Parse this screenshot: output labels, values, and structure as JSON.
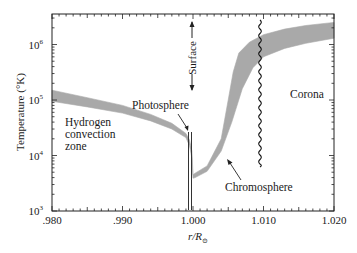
{
  "chart_data": {
    "type": "area",
    "title": "",
    "xlabel": "r/R⊙",
    "ylabel": "Temperature (°K)",
    "xlim": [
      0.98,
      1.02
    ],
    "ylim_log10": [
      3,
      6.55
    ],
    "yscale": "log",
    "grid": false,
    "legend": null,
    "x_ticks": [
      ".980",
      ".990",
      "1.000",
      "1.010",
      "1.020"
    ],
    "x_tick_values": [
      0.98,
      0.99,
      1.0,
      1.01,
      1.02
    ],
    "y_ticks": [
      "10^3",
      "10^4",
      "10^5",
      "10^6"
    ],
    "y_tick_values": [
      1000,
      10000,
      100000,
      1000000
    ],
    "series": [
      {
        "name": "Temperature band (upper bound)",
        "x": [
          0.98,
          0.985,
          0.99,
          0.994,
          0.997,
          0.999,
          0.9995,
          0.99985,
          1.0,
          1.0003,
          1.002,
          1.004,
          1.005,
          1.0057,
          1.0065,
          1.008,
          1.01,
          1.013,
          1.016,
          1.02
        ],
        "y": [
          150000,
          110000,
          80000,
          55000,
          38000,
          25000,
          19000,
          12000,
          4500,
          4800,
          6500,
          20000,
          100000,
          320000,
          700000,
          1100000,
          1500000,
          1900000,
          2200000,
          2500000
        ]
      },
      {
        "name": "Temperature band (lower bound)",
        "x": [
          0.98,
          0.985,
          0.99,
          0.994,
          0.997,
          0.999,
          0.9995,
          0.99985,
          1.0,
          1.0003,
          1.002,
          1.004,
          1.0055,
          1.007,
          1.0085,
          1.01,
          1.013,
          1.016,
          1.02
        ],
        "y": [
          95000,
          75000,
          58000,
          42000,
          30000,
          21000,
          15000,
          9000,
          3900,
          4000,
          5200,
          12000,
          40000,
          160000,
          380000,
          600000,
          850000,
          1050000,
          1300000
        ]
      }
    ],
    "annotations": [
      {
        "text": "Hydrogen",
        "x": 0.981,
        "y": 45000
      },
      {
        "text": "convection",
        "x": 0.981,
        "y": 28000
      },
      {
        "text": "zone",
        "x": 0.981,
        "y": 17000
      },
      {
        "text": "Photosphere",
        "x": 0.9955,
        "y": 32000,
        "arrow_to": [
          0.9995,
          18000
        ]
      },
      {
        "text": "Chromosphere",
        "x": 1.0036,
        "y": 2800,
        "arrow_to": [
          1.0035,
          9000
        ]
      },
      {
        "text": "Corona",
        "x": 1.014,
        "y": 100000
      },
      {
        "text": "← Surface →",
        "x": 1.0,
        "y": 300000,
        "rotated": true
      },
      {
        "text": "Photosphere boundary (double vertical line)",
        "x": 1.0,
        "y_range": [
          1000,
          18000
        ]
      },
      {
        "text": "Transition to corona (wavy vertical line)",
        "x": 1.0095,
        "y_range": [
          5000,
          3000000
        ]
      }
    ]
  },
  "labels": {
    "ylabel": "Temperature (°K)",
    "xlabel_main": "r/R",
    "xlabel_sub": "⊙",
    "hydrogen_1": "Hydrogen",
    "hydrogen_2": "convection",
    "hydrogen_3": "zone",
    "photosphere": "Photosphere",
    "chromosphere": "Chromosphere",
    "corona": "Corona",
    "surface": "Surface"
  },
  "colors": {
    "band": "#a9a9a9",
    "axis": "#222222",
    "text": "#1a1a1a"
  }
}
